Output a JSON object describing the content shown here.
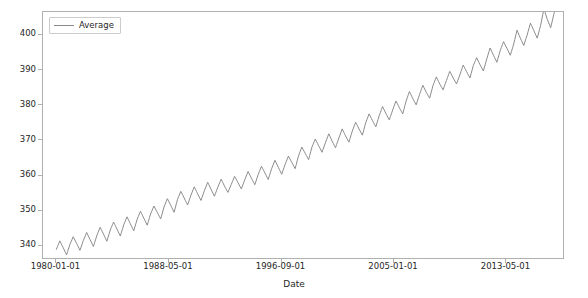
{
  "figure": {
    "background_color": "#ffffff",
    "axes_edge_color": "#b0b0b0",
    "line_color": "#8a8a8a",
    "tick_color": "#262626"
  },
  "legend": {
    "entries": [
      {
        "label": "Average",
        "color": "#8a8a8a",
        "marker": "line-swatch"
      }
    ],
    "position": "upper left",
    "frame": true
  },
  "axis": {
    "xlabel": "Date",
    "ylabel": "",
    "x_tick_labels": [
      "1980-01-01",
      "1988-05-01",
      "1996-09-01",
      "2005-01-01",
      "2013-05-01"
    ],
    "y_tick_labels": [
      "340",
      "350",
      "360",
      "370",
      "380",
      "390",
      "400"
    ]
  },
  "chart_data": {
    "type": "line",
    "title": "",
    "xlabel": "Date",
    "ylabel": "",
    "grid": false,
    "legend_position": "upper left",
    "xlim": [
      "1979-01-01",
      "2017-09-01"
    ],
    "ylim": [
      336.0,
      406.5
    ],
    "x_ticks": [
      "1980-01-01",
      "1988-05-01",
      "1996-09-01",
      "2005-01-01",
      "2013-05-01"
    ],
    "y_ticks": [
      340,
      350,
      360,
      370,
      380,
      390,
      400
    ],
    "series": [
      {
        "name": "Average",
        "color": "#8a8a8a",
        "linewidth": 1,
        "x": [
          "1980-01-01",
          "1980-04-01",
          "1980-07-01",
          "1980-10-01",
          "1981-01-01",
          "1981-04-01",
          "1981-07-01",
          "1981-10-01",
          "1982-01-01",
          "1982-04-01",
          "1982-07-01",
          "1982-10-01",
          "1983-01-01",
          "1983-04-01",
          "1983-07-01",
          "1983-10-01",
          "1984-01-01",
          "1984-04-01",
          "1984-07-01",
          "1984-10-01",
          "1985-01-01",
          "1985-04-01",
          "1985-07-01",
          "1985-10-01",
          "1986-01-01",
          "1986-04-01",
          "1986-07-01",
          "1986-10-01",
          "1987-01-01",
          "1987-04-01",
          "1987-07-01",
          "1987-10-01",
          "1988-01-01",
          "1988-04-01",
          "1988-07-01",
          "1988-10-01",
          "1989-01-01",
          "1989-04-01",
          "1989-07-01",
          "1989-10-01",
          "1990-01-01",
          "1990-04-01",
          "1990-07-01",
          "1990-10-01",
          "1991-01-01",
          "1991-04-01",
          "1991-07-01",
          "1991-10-01",
          "1992-01-01",
          "1992-04-01",
          "1992-07-01",
          "1992-10-01",
          "1993-01-01",
          "1993-04-01",
          "1993-07-01",
          "1993-10-01",
          "1994-01-01",
          "1994-04-01",
          "1994-07-01",
          "1994-10-01",
          "1995-01-01",
          "1995-04-01",
          "1995-07-01",
          "1995-10-01",
          "1996-01-01",
          "1996-04-01",
          "1996-07-01",
          "1996-10-01",
          "1997-01-01",
          "1997-04-01",
          "1997-07-01",
          "1997-10-01",
          "1998-01-01",
          "1998-04-01",
          "1998-07-01",
          "1998-10-01",
          "1999-01-01",
          "1999-04-01",
          "1999-07-01",
          "1999-10-01",
          "2000-01-01",
          "2000-04-01",
          "2000-07-01",
          "2000-10-01",
          "2001-01-01",
          "2001-04-01",
          "2001-07-01",
          "2001-10-01",
          "2002-01-01",
          "2002-04-01",
          "2002-07-01",
          "2002-10-01",
          "2003-01-01",
          "2003-04-01",
          "2003-07-01",
          "2003-10-01",
          "2004-01-01",
          "2004-04-01",
          "2004-07-01",
          "2004-10-01",
          "2005-01-01",
          "2005-04-01",
          "2005-07-01",
          "2005-10-01",
          "2006-01-01",
          "2006-04-01",
          "2006-07-01",
          "2006-10-01",
          "2007-01-01",
          "2007-04-01",
          "2007-07-01",
          "2007-10-01",
          "2008-01-01",
          "2008-04-01",
          "2008-07-01",
          "2008-10-01",
          "2009-01-01",
          "2009-04-01",
          "2009-07-01",
          "2009-10-01",
          "2010-01-01",
          "2010-04-01",
          "2010-07-01",
          "2010-10-01",
          "2011-01-01",
          "2011-04-01",
          "2011-07-01",
          "2011-10-01",
          "2012-01-01",
          "2012-04-01",
          "2012-07-01",
          "2012-10-01",
          "2013-01-01",
          "2013-04-01",
          "2013-07-01",
          "2013-10-01",
          "2014-01-01",
          "2014-04-01",
          "2014-07-01",
          "2014-10-01",
          "2015-01-01",
          "2015-04-01",
          "2015-07-01",
          "2015-10-01",
          "2016-01-01",
          "2016-04-01",
          "2016-07-01",
          "2016-10-01",
          "2017-01-01",
          "2017-04-01",
          "2017-07-01"
        ],
        "y": [
          338.5,
          340.9,
          339.0,
          336.9,
          339.9,
          342.1,
          340.2,
          338.2,
          341.0,
          343.3,
          341.3,
          339.3,
          342.4,
          344.8,
          342.9,
          340.8,
          344.0,
          346.3,
          344.3,
          342.3,
          345.5,
          347.8,
          345.8,
          343.8,
          347.1,
          349.4,
          347.4,
          345.4,
          348.6,
          350.9,
          349.1,
          347.2,
          350.6,
          353.0,
          351.1,
          349.1,
          352.8,
          355.1,
          353.2,
          351.2,
          354.0,
          356.4,
          354.4,
          352.5,
          355.3,
          357.7,
          355.7,
          353.7,
          356.3,
          358.6,
          356.6,
          354.8,
          357.1,
          359.4,
          357.6,
          355.8,
          358.4,
          360.8,
          358.9,
          357.0,
          359.9,
          362.3,
          360.4,
          358.5,
          361.6,
          364.0,
          362.0,
          360.0,
          362.8,
          365.2,
          363.4,
          361.6,
          365.3,
          367.8,
          366.0,
          364.2,
          367.8,
          370.1,
          368.2,
          366.3,
          369.0,
          371.6,
          369.5,
          367.6,
          370.4,
          373.0,
          371.0,
          369.2,
          372.4,
          374.9,
          373.0,
          371.2,
          374.8,
          377.3,
          375.4,
          373.6,
          376.8,
          379.4,
          377.4,
          375.6,
          378.4,
          381.0,
          379.1,
          377.3,
          381.0,
          383.7,
          381.7,
          379.9,
          382.9,
          385.5,
          383.5,
          381.8,
          385.4,
          387.9,
          385.9,
          384.2,
          386.9,
          389.5,
          387.6,
          385.9,
          388.5,
          391.3,
          389.4,
          387.6,
          391.2,
          393.4,
          391.4,
          389.6,
          393.1,
          396.2,
          394.1,
          392.1,
          395.5,
          398.0,
          396.1,
          394.1,
          397.3,
          401.3,
          399.0,
          396.9,
          399.9,
          403.3,
          401.2,
          399.0,
          402.6,
          407.4,
          404.4,
          402.0,
          406.1,
          409.0,
          407.2
        ]
      }
    ]
  }
}
